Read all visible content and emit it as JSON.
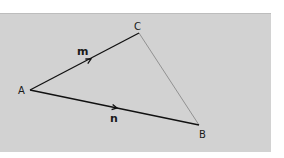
{
  "diagram": {
    "type": "vector-triangle",
    "background_color": "#d2d2d2",
    "points": {
      "A": {
        "label": "A",
        "x": 30,
        "y": 90
      },
      "B": {
        "label": "B",
        "x": 199,
        "y": 125
      },
      "C": {
        "label": "C",
        "x": 139,
        "y": 33
      }
    },
    "edges": [
      {
        "from": "A",
        "to": "C",
        "vector_label": "m",
        "arrow": true,
        "color": "#111111"
      },
      {
        "from": "A",
        "to": "B",
        "vector_label": "n",
        "arrow": true,
        "color": "#111111"
      },
      {
        "from": "C",
        "to": "B",
        "vector_label": "",
        "arrow": false,
        "color": "#8a8a8a"
      }
    ],
    "labels": {
      "A": "A",
      "B": "B",
      "C": "C",
      "m": "m",
      "n": "n"
    }
  }
}
